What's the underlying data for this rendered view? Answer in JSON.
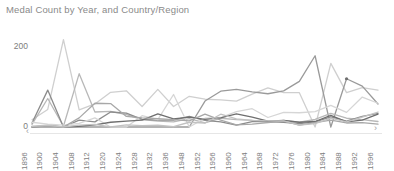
{
  "header": {
    "title": "Medal Count by Year, and Country/Region"
  },
  "axis": {
    "y_ticks": [
      "200",
      "0"
    ],
    "scroll_left_icon": "chevron-left-icon",
    "scroll_right_icon": "chevron-right-icon",
    "scroll_left_glyph": "‹",
    "scroll_right_glyph": "›"
  },
  "colors": {
    "title": "#8a8a8a",
    "tick": "#7d7d7d",
    "axis_line": "#e6e6e6",
    "series": [
      "#cfcfcf",
      "#9a9a9a",
      "#b8b8b8",
      "#8c8c8c",
      "#d6d6d6",
      "#6f6f6f",
      "#a8a8a8",
      "#c2c2c2"
    ]
  },
  "chart_data": {
    "type": "line",
    "title": "Medal Count by Year, and Country/Region",
    "xlabel": "",
    "ylabel": "",
    "ylim": [
      0,
      260
    ],
    "grid": false,
    "legend": "none",
    "categories": [
      "1896",
      "1900",
      "1904",
      "1908",
      "1912",
      "1920",
      "1924",
      "1928",
      "1932",
      "1936",
      "1948",
      "1952",
      "1956",
      "1960",
      "1964",
      "1968",
      "1972",
      "1976",
      "1980",
      "1984",
      "1988",
      "1992",
      "1996"
    ],
    "series": [
      {
        "name": "United States",
        "color": "#cfcfcf",
        "values": [
          20,
          48,
          239,
          47,
          63,
          95,
          99,
          56,
          103,
          56,
          84,
          76,
          74,
          71,
          90,
          107,
          94,
          94,
          0,
          174,
          94,
          108,
          101
        ]
      },
      {
        "name": "Soviet Union",
        "color": "#9a9a9a",
        "values": [
          0,
          0,
          0,
          0,
          0,
          0,
          0,
          0,
          0,
          0,
          0,
          71,
          98,
          103,
          96,
          91,
          99,
          125,
          195,
          0,
          132,
          112,
          63
        ]
      },
      {
        "name": "Great Britain",
        "color": "#b8b8b8",
        "values": [
          7,
          78,
          2,
          146,
          41,
          43,
          34,
          20,
          16,
          14,
          23,
          11,
          24,
          20,
          18,
          13,
          18,
          13,
          21,
          37,
          24,
          20,
          15
        ]
      },
      {
        "name": "France",
        "color": "#8c8c8c",
        "values": [
          11,
          101,
          0,
          19,
          14,
          41,
          38,
          21,
          19,
          19,
          29,
          18,
          14,
          5,
          15,
          15,
          13,
          9,
          14,
          28,
          16,
          29,
          37
        ]
      },
      {
        "name": "Germany",
        "color": "#d6d6d6",
        "values": [
          13,
          8,
          5,
          10,
          25,
          0,
          0,
          31,
          20,
          89,
          0,
          24,
          26,
          42,
          50,
          26,
          40,
          39,
          42,
          59,
          40,
          82,
          65
        ]
      },
      {
        "name": "Italy",
        "color": "#6f6f6f",
        "values": [
          0,
          4,
          0,
          2,
          6,
          13,
          16,
          19,
          36,
          22,
          27,
          21,
          25,
          36,
          27,
          16,
          18,
          13,
          15,
          32,
          14,
          19,
          35
        ]
      },
      {
        "name": "Sweden",
        "color": "#a8a8a8",
        "values": [
          0,
          2,
          0,
          25,
          65,
          64,
          29,
          25,
          23,
          20,
          17,
          35,
          19,
          6,
          8,
          12,
          16,
          5,
          12,
          19,
          11,
          12,
          8
        ]
      },
      {
        "name": "Australia",
        "color": "#c2c2c2",
        "values": [
          2,
          5,
          0,
          5,
          7,
          0,
          6,
          4,
          5,
          1,
          13,
          11,
          35,
          22,
          18,
          17,
          17,
          5,
          9,
          24,
          14,
          27,
          41
        ]
      }
    ],
    "markers": [
      {
        "series": "Soviet Union",
        "x": "1988",
        "y": 132,
        "note": "single-point-marker"
      }
    ]
  }
}
